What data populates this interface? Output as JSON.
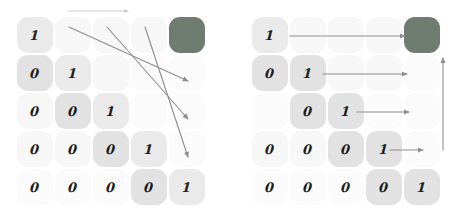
{
  "figure": {
    "panel_count": 2,
    "grid_rows": 5,
    "grid_cols": 5,
    "colors": {
      "highlight_cell": "#6f7c70",
      "arrow": "#8d8d93",
      "arrow_light": "#c9c9cf",
      "digit": "#1c1c1c",
      "background": "#ffffff",
      "cell_tone_a": "#eaeaea",
      "cell_tone_b": "#e2e2e2",
      "cell_tone_c": "#f2f2f2",
      "cell_tone_d": "#f7f7f7",
      "cell_tone_e": "#fbfbfb"
    }
  },
  "left_panel": {
    "name": "anti-diagonal-traversal",
    "matrix": [
      [
        "1",
        "",
        "",
        "",
        ""
      ],
      [
        "0",
        "1",
        "",
        "",
        ""
      ],
      [
        "0",
        "0",
        "1",
        "",
        ""
      ],
      [
        "0",
        "0",
        "0",
        "1",
        ""
      ],
      [
        "0",
        "0",
        "0",
        "0",
        "1"
      ]
    ],
    "cells": [
      {
        "r": 0,
        "c": 0,
        "v": "1",
        "tone": "tone-a",
        "highlight": false
      },
      {
        "r": 0,
        "c": 1,
        "v": "",
        "tone": "tone-d",
        "highlight": false
      },
      {
        "r": 0,
        "c": 2,
        "v": "",
        "tone": "tone-d",
        "highlight": false
      },
      {
        "r": 0,
        "c": 3,
        "v": "",
        "tone": "tone-d",
        "highlight": false
      },
      {
        "r": 0,
        "c": 4,
        "v": "",
        "tone": "tone-d",
        "highlight": true
      },
      {
        "r": 1,
        "c": 0,
        "v": "0",
        "tone": "tone-b",
        "highlight": false
      },
      {
        "r": 1,
        "c": 1,
        "v": "1",
        "tone": "tone-a",
        "highlight": false
      },
      {
        "r": 1,
        "c": 2,
        "v": "",
        "tone": "tone-d",
        "highlight": false
      },
      {
        "r": 1,
        "c": 3,
        "v": "",
        "tone": "tone-e",
        "highlight": false
      },
      {
        "r": 1,
        "c": 4,
        "v": "",
        "tone": "tone-e",
        "highlight": false
      },
      {
        "r": 2,
        "c": 0,
        "v": "0",
        "tone": "tone-d",
        "highlight": false
      },
      {
        "r": 2,
        "c": 1,
        "v": "0",
        "tone": "tone-b",
        "highlight": false
      },
      {
        "r": 2,
        "c": 2,
        "v": "1",
        "tone": "tone-a",
        "highlight": false
      },
      {
        "r": 2,
        "c": 3,
        "v": "",
        "tone": "tone-e",
        "highlight": false
      },
      {
        "r": 2,
        "c": 4,
        "v": "",
        "tone": "tone-e",
        "highlight": false
      },
      {
        "r": 3,
        "c": 0,
        "v": "0",
        "tone": "tone-d",
        "highlight": false
      },
      {
        "r": 3,
        "c": 1,
        "v": "0",
        "tone": "tone-d",
        "highlight": false
      },
      {
        "r": 3,
        "c": 2,
        "v": "0",
        "tone": "tone-b",
        "highlight": false
      },
      {
        "r": 3,
        "c": 3,
        "v": "1",
        "tone": "tone-a",
        "highlight": false
      },
      {
        "r": 3,
        "c": 4,
        "v": "",
        "tone": "tone-e",
        "highlight": false
      },
      {
        "r": 4,
        "c": 0,
        "v": "0",
        "tone": "tone-e",
        "highlight": false
      },
      {
        "r": 4,
        "c": 1,
        "v": "0",
        "tone": "tone-e",
        "highlight": false
      },
      {
        "r": 4,
        "c": 2,
        "v": "0",
        "tone": "tone-e",
        "highlight": false
      },
      {
        "r": 4,
        "c": 3,
        "v": "0",
        "tone": "tone-b",
        "highlight": false
      },
      {
        "r": 4,
        "c": 4,
        "v": "1",
        "tone": "tone-a",
        "highlight": false
      }
    ],
    "arrows": [
      {
        "name": "top-horizontal-arrow",
        "kind": "horizontal",
        "x1": 68,
        "y1": 11,
        "x2": 128,
        "y2": 11,
        "light": true
      },
      {
        "name": "diagonal-arrow-1",
        "kind": "diagonal",
        "x1": 69,
        "y1": 27,
        "x2": 188,
        "y2": 81,
        "light": false
      },
      {
        "name": "diagonal-arrow-2",
        "kind": "diagonal",
        "x1": 107,
        "y1": 27,
        "x2": 188,
        "y2": 119,
        "light": false
      },
      {
        "name": "diagonal-arrow-3",
        "kind": "diagonal",
        "x1": 145,
        "y1": 27,
        "x2": 188,
        "y2": 157,
        "light": false
      }
    ]
  },
  "right_panel": {
    "name": "row-wise-traversal",
    "matrix": [
      [
        "1",
        "",
        "",
        "",
        ""
      ],
      [
        "0",
        "1",
        "",
        "",
        ""
      ],
      [
        "",
        "0",
        "1",
        "",
        ""
      ],
      [
        "0",
        "0",
        "0",
        "1",
        ""
      ],
      [
        "0",
        "0",
        "0",
        "0",
        "1"
      ]
    ],
    "cells": [
      {
        "r": 0,
        "c": 0,
        "v": "1",
        "tone": "tone-a",
        "highlight": false
      },
      {
        "r": 0,
        "c": 1,
        "v": "",
        "tone": "tone-d",
        "highlight": false
      },
      {
        "r": 0,
        "c": 2,
        "v": "",
        "tone": "tone-d",
        "highlight": false
      },
      {
        "r": 0,
        "c": 3,
        "v": "",
        "tone": "tone-d",
        "highlight": false
      },
      {
        "r": 0,
        "c": 4,
        "v": "",
        "tone": "tone-d",
        "highlight": true
      },
      {
        "r": 1,
        "c": 0,
        "v": "0",
        "tone": "tone-b",
        "highlight": false
      },
      {
        "r": 1,
        "c": 1,
        "v": "1",
        "tone": "tone-b",
        "highlight": false
      },
      {
        "r": 1,
        "c": 2,
        "v": "",
        "tone": "tone-d",
        "highlight": false
      },
      {
        "r": 1,
        "c": 3,
        "v": "",
        "tone": "tone-d",
        "highlight": false
      },
      {
        "r": 1,
        "c": 4,
        "v": "",
        "tone": "tone-e",
        "highlight": false
      },
      {
        "r": 2,
        "c": 0,
        "v": "",
        "tone": "tone-e",
        "highlight": false
      },
      {
        "r": 2,
        "c": 1,
        "v": "0",
        "tone": "tone-b",
        "highlight": false
      },
      {
        "r": 2,
        "c": 2,
        "v": "1",
        "tone": "tone-b",
        "highlight": false
      },
      {
        "r": 2,
        "c": 3,
        "v": "",
        "tone": "tone-e",
        "highlight": false
      },
      {
        "r": 2,
        "c": 4,
        "v": "",
        "tone": "tone-e",
        "highlight": false
      },
      {
        "r": 3,
        "c": 0,
        "v": "0",
        "tone": "tone-d",
        "highlight": false
      },
      {
        "r": 3,
        "c": 1,
        "v": "0",
        "tone": "tone-d",
        "highlight": false
      },
      {
        "r": 3,
        "c": 2,
        "v": "0",
        "tone": "tone-b",
        "highlight": false
      },
      {
        "r": 3,
        "c": 3,
        "v": "1",
        "tone": "tone-b",
        "highlight": false
      },
      {
        "r": 3,
        "c": 4,
        "v": "",
        "tone": "tone-e",
        "highlight": false
      },
      {
        "r": 4,
        "c": 0,
        "v": "0",
        "tone": "tone-e",
        "highlight": false
      },
      {
        "r": 4,
        "c": 1,
        "v": "0",
        "tone": "tone-e",
        "highlight": false
      },
      {
        "r": 4,
        "c": 2,
        "v": "0",
        "tone": "tone-e",
        "highlight": false
      },
      {
        "r": 4,
        "c": 3,
        "v": "0",
        "tone": "tone-b",
        "highlight": false
      },
      {
        "r": 4,
        "c": 4,
        "v": "1",
        "tone": "tone-b",
        "highlight": false
      }
    ],
    "arrows": [
      {
        "name": "row-arrow-1",
        "kind": "horizontal",
        "x1": 57,
        "y1": 36,
        "x2": 172,
        "y2": 36,
        "light": false
      },
      {
        "name": "row-arrow-2",
        "kind": "horizontal",
        "x1": 90,
        "y1": 74,
        "x2": 174,
        "y2": 74,
        "light": false
      },
      {
        "name": "row-arrow-3",
        "kind": "horizontal",
        "x1": 124,
        "y1": 112,
        "x2": 176,
        "y2": 112,
        "light": false
      },
      {
        "name": "row-arrow-4",
        "kind": "horizontal",
        "x1": 157,
        "y1": 150,
        "x2": 190,
        "y2": 150,
        "light": false
      },
      {
        "name": "vertical-arrow",
        "kind": "vertical",
        "x1": 210,
        "y1": 150,
        "x2": 210,
        "y2": 58,
        "light": false
      }
    ]
  }
}
